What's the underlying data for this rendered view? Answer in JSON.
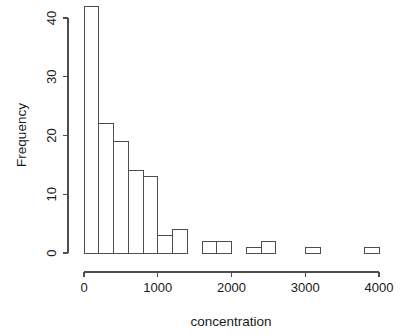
{
  "chart_data": {
    "type": "bar",
    "subtype": "histogram",
    "title": "",
    "xlabel": "concentration",
    "ylabel": "Frequency",
    "xlim": [
      0,
      4000
    ],
    "ylim": [
      0,
      42
    ],
    "grid": false,
    "legend": false,
    "bin_width": 200,
    "bin_edges": [
      0,
      200,
      400,
      600,
      800,
      1000,
      1200,
      1400,
      1600,
      1800,
      2000,
      2200,
      2400,
      2600,
      2800,
      3000,
      3200,
      3400,
      3600,
      3800,
      4000
    ],
    "bin_centers": [
      100,
      300,
      500,
      700,
      900,
      1100,
      1300,
      1500,
      1700,
      1900,
      2100,
      2300,
      2500,
      2700,
      2900,
      3100,
      3300,
      3500,
      3700,
      3900
    ],
    "values": [
      42,
      22,
      19,
      14,
      13,
      3,
      4,
      0,
      2,
      2,
      0,
      1,
      2,
      0,
      0,
      1,
      0,
      0,
      0,
      1
    ],
    "x_ticks": [
      0,
      1000,
      2000,
      3000,
      4000
    ],
    "x_tick_labels": [
      "0",
      "1000",
      "2000",
      "3000",
      "4000"
    ],
    "y_ticks": [
      0,
      10,
      20,
      30,
      40
    ],
    "y_tick_labels": [
      "0",
      "10",
      "20",
      "30",
      "40"
    ],
    "bar_fill_color": "#ffffff",
    "bar_stroke_color": "#4d4d4d",
    "background_color": "#ffffff",
    "text_color": "#1a1a1a"
  },
  "axes": {
    "x_axis_name": "concentration-axis",
    "y_axis_name": "frequency-axis"
  }
}
